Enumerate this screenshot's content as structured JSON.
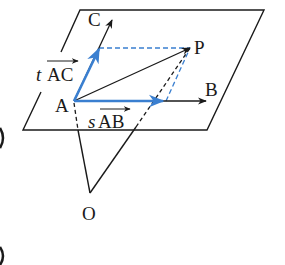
{
  "figure": {
    "points": {
      "A": {
        "label": "A",
        "x": 74,
        "y": 101
      },
      "B": {
        "label": "B",
        "x": 206,
        "y": 101
      },
      "C": {
        "label": "C",
        "x": 112,
        "y": 20
      },
      "P": {
        "label": "P",
        "x": 190,
        "y": 47
      },
      "O": {
        "label": "O",
        "x": 90,
        "y": 195
      }
    },
    "vector_labels": {
      "tAC": {
        "scalar": "t",
        "vector": "AC"
      },
      "sAB": {
        "scalar": "s",
        "vector": "AB"
      }
    },
    "colors": {
      "ink": "#1a1a1a",
      "blue": "#3a7fd0"
    }
  }
}
